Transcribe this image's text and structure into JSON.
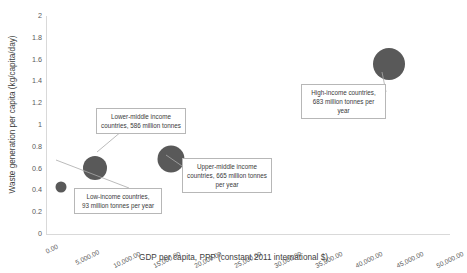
{
  "chart_data": {
    "type": "scatter",
    "title": "",
    "xlabel": "GDP per capita, PPP (constant 2011 international $)",
    "ylabel": "Waste generation per capita (kg/capita/day)",
    "xlim": [
      0,
      50000
    ],
    "ylim": [
      0,
      2
    ],
    "grid": false,
    "legend": "none",
    "x_ticks": [
      "0.00",
      "5,000.00",
      "10,000.00",
      "15,000.00",
      "20,000.00",
      "25,000.00",
      "30,000.00",
      "35,000.00",
      "40,000.00",
      "45,000.00",
      "50,000.00"
    ],
    "x_tick_values": [
      0,
      5000,
      10000,
      15000,
      20000,
      25000,
      30000,
      35000,
      40000,
      45000,
      50000
    ],
    "y_ticks": [
      "0",
      "0.2",
      "0.4",
      "0.6",
      "0.8",
      "1",
      "1.2",
      "1.4",
      "1.6",
      "1.8",
      "2"
    ],
    "y_tick_values": [
      0,
      0.2,
      0.4,
      0.6,
      0.8,
      1,
      1.2,
      1.4,
      1.6,
      1.8,
      2
    ],
    "marker_color": "#595959",
    "points": [
      {
        "name": "Low-income countries",
        "x": 1800,
        "y": 0.43,
        "size": 11,
        "waste_million_tonnes": 93
      },
      {
        "name": "Lower-middle income countries",
        "x": 6050,
        "y": 0.61,
        "size": 24,
        "waste_million_tonnes": 586
      },
      {
        "name": "Upper-middle income countries",
        "x": 15500,
        "y": 0.69,
        "size": 27,
        "waste_million_tonnes": 665
      },
      {
        "name": "High-income countries",
        "x": 42500,
        "y": 1.56,
        "size": 32,
        "waste_million_tonnes": 683
      }
    ],
    "annotations": [
      {
        "id": "low-income",
        "text": "Low-income countries,\n93 million tonnes per year",
        "box": {
          "left": 74,
          "top": 188,
          "width": 88,
          "height": 22
        },
        "leader_from": {
          "x": 129,
          "y": 188
        },
        "leader_to": {
          "x": 56,
          "y": 160
        }
      },
      {
        "id": "lower-middle",
        "text": "Lower-middle income\ncountries, 586 million tonnes",
        "box": {
          "left": 96,
          "top": 108,
          "width": 90,
          "height": 23
        },
        "leader_from": {
          "x": 122,
          "y": 131
        },
        "leader_to": {
          "x": 97,
          "y": 152
        }
      },
      {
        "id": "upper-middle",
        "text": "Upper-middle income\ncountries, 665 million tonnes\nper year",
        "box": {
          "left": 182,
          "top": 158,
          "width": 90,
          "height": 31
        },
        "leader_from": {
          "x": 182,
          "y": 166
        },
        "leader_to": {
          "x": 166,
          "y": 155
        }
      },
      {
        "id": "high-income",
        "text": "High-income countries,\n683 million tonnes per\nyear",
        "box": {
          "left": 301,
          "top": 84,
          "width": 85,
          "height": 32
        },
        "leader_from": {
          "x": 386,
          "y": 92
        },
        "leader_to": {
          "x": 382,
          "y": 72
        }
      }
    ]
  }
}
